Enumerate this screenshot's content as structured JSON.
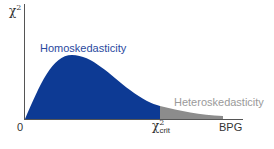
{
  "diagram": {
    "y_axis_label": "χ",
    "y_axis_label_sup": "2",
    "region_left_label": "Homoskedasticity",
    "region_right_label": "Heteroskedasticity",
    "x_origin_label": "0",
    "critical_value_label": "χ",
    "critical_value_sup": "2",
    "critical_value_sub": "crit",
    "x_axis_end_label": "BPG",
    "colors": {
      "homoskedasticity_fill": "#0d3a94",
      "heteroskedasticity_fill": "#8c8c8c",
      "axis": "#555555",
      "homoskedasticity_text": "#2a4aa0",
      "heteroskedasticity_text": "#9a9a9a"
    }
  }
}
